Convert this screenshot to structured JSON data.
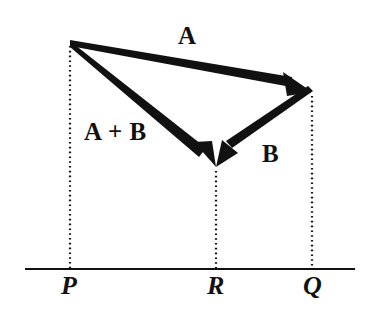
{
  "figure": {
    "kind": "vector-addition-diagram",
    "background_color": "#ffffff",
    "ink_color": "#111111"
  },
  "labels": {
    "vector_a": "A",
    "vector_sum": "A + B",
    "vector_b": "B",
    "point_p": "P",
    "point_r": "R",
    "point_q": "Q"
  },
  "geometry": {
    "apex_top_left": {
      "x": 70,
      "y": 42
    },
    "apex_top_right": {
      "x": 312,
      "y": 92
    },
    "vertex_bottom_mid": {
      "x": 216,
      "y": 167
    },
    "baseline": {
      "y": 269,
      "x_start": 25,
      "x_end": 355
    },
    "drop_lines_x": [
      70,
      216,
      312
    ]
  },
  "vectors": [
    {
      "name": "A",
      "label": "A",
      "from": "P-top",
      "to": "Q-top",
      "start": {
        "x": 70,
        "y": 42
      },
      "end": {
        "x": 312,
        "y": 92
      }
    },
    {
      "name": "A+B",
      "label": "A + B",
      "from": "P-top",
      "to": "R",
      "start": {
        "x": 70,
        "y": 42
      },
      "end": {
        "x": 216,
        "y": 167
      }
    },
    {
      "name": "B",
      "label": "B",
      "from": "Q-top",
      "to": "R",
      "start": {
        "x": 312,
        "y": 92
      },
      "end": {
        "x": 216,
        "y": 167
      }
    }
  ],
  "base_points": [
    {
      "label": "P",
      "x": 70,
      "y": 269
    },
    {
      "label": "R",
      "x": 216,
      "y": 269
    },
    {
      "label": "Q",
      "x": 312,
      "y": 269
    }
  ]
}
